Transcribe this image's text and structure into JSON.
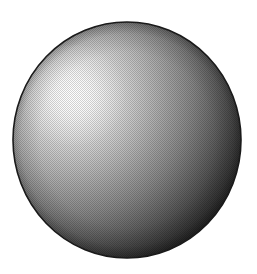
{
  "figure": {
    "description": "Grayscale rendering of a sphere with a specular highlight in the upper-left, shading to near black toward the lower-right. Rendered with a fine halftone dither pattern.",
    "type": "raster-illustration",
    "canvas": {
      "width": 257,
      "height": 274,
      "background_color": "#ffffff"
    },
    "sphere": {
      "name": "sphere",
      "center_x": 127,
      "center_y": 140,
      "radius_x": 114,
      "radius_y": 118,
      "outline_color": "#1a1a1a",
      "outline_width": 1.6,
      "base_color": "#8c8c8c"
    },
    "specular_highlight": {
      "name": "specular-highlight",
      "center_x": 73,
      "center_y": 95,
      "radius": 52,
      "peak_color": "#fdfdfd",
      "intensity": 1.0
    },
    "shading": {
      "model": "diffuse-plus-specular",
      "light_direction": "upper-left",
      "gradient_stops": [
        {
          "offset": "0%",
          "color": "#fbfbfb"
        },
        {
          "offset": "9%",
          "color": "#f2f2f2"
        },
        {
          "offset": "18%",
          "color": "#e2e2e2"
        },
        {
          "offset": "28%",
          "color": "#cdcdcd"
        },
        {
          "offset": "38%",
          "color": "#b6b6b6"
        },
        {
          "offset": "48%",
          "color": "#9e9e9e"
        },
        {
          "offset": "58%",
          "color": "#868686"
        },
        {
          "offset": "68%",
          "color": "#6b6b6b"
        },
        {
          "offset": "78%",
          "color": "#4f4f4f"
        },
        {
          "offset": "87%",
          "color": "#363636"
        },
        {
          "offset": "94%",
          "color": "#232323"
        },
        {
          "offset": "100%",
          "color": "#141414"
        }
      ],
      "terminator_color": "#151515",
      "darkest_color": "#111111",
      "lightest_color": "#fdfdfd"
    },
    "halftone": {
      "name": "halftone-dither",
      "pattern": "checkerboard",
      "cell_size": 2,
      "opacity": 0.17,
      "dot_color": "#000000"
    }
  },
  "chart_data": {
    "type": "heatmap",
    "xlabel": "",
    "ylabel": "",
    "x": [
      15,
      71,
      127,
      183,
      240
    ],
    "y": [
      22,
      81,
      140,
      199,
      258
    ],
    "values": [
      [
        255,
        120,
        95,
        70,
        255
      ],
      [
        150,
        245,
        175,
        90,
        45
      ],
      [
        130,
        200,
        150,
        72,
        28
      ],
      [
        105,
        150,
        110,
        52,
        20
      ],
      [
        255,
        95,
        62,
        30,
        255
      ]
    ],
    "zlim": [
      0,
      255
    ],
    "grid": false,
    "legend": "none",
    "colormap": "grayscale"
  }
}
